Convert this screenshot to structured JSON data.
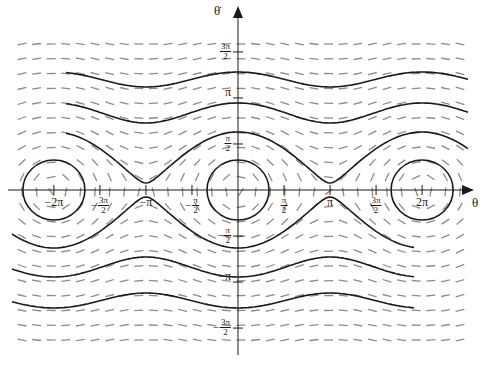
{
  "diagram": {
    "type": "phase-portrait",
    "title": "",
    "origin_px": [
      238,
      190
    ],
    "px_per_unit": 29.3,
    "colors": {
      "trajectory": "#1a1a1a",
      "slope_field": "#8c8c8c",
      "axis": "#1a1a1a"
    },
    "axes": {
      "x_label": "θ",
      "y_label": "θ̇",
      "x_ticks": [
        {
          "value": -6.2832,
          "label": "−2π",
          "type": "text"
        },
        {
          "value": -4.7124,
          "num": "3π",
          "den": "2",
          "sign": "−",
          "type": "frac"
        },
        {
          "value": -3.1416,
          "label": "−π",
          "type": "text"
        },
        {
          "value": -1.5708,
          "num": "π",
          "den": "2",
          "sign": "−",
          "type": "frac"
        },
        {
          "value": 1.5708,
          "num": "π",
          "den": "2",
          "sign": "",
          "type": "frac"
        },
        {
          "value": 3.1416,
          "label": "π",
          "type": "text"
        },
        {
          "value": 4.7124,
          "num": "3π",
          "den": "2",
          "sign": "",
          "type": "frac"
        },
        {
          "value": 6.2832,
          "label": "2π",
          "type": "text"
        }
      ],
      "y_ticks": [
        {
          "value": 4.7124,
          "num": "3π",
          "den": "2",
          "sign": "",
          "type": "frac"
        },
        {
          "value": 3.1416,
          "label": "π",
          "type": "text"
        },
        {
          "value": 1.5708,
          "num": "π",
          "den": "2",
          "sign": "",
          "type": "frac"
        },
        {
          "value": -1.5708,
          "num": "π",
          "den": "2",
          "sign": "−",
          "type": "frac"
        },
        {
          "value": -3.1416,
          "label": "−π",
          "type": "text"
        },
        {
          "value": -4.7124,
          "num": "3π",
          "den": "2",
          "sign": "−",
          "type": "frac"
        }
      ]
    },
    "slope_field": {
      "x_start_px": 22,
      "x_step_px": 14.6,
      "cols": 31,
      "y_start_px": 44,
      "y_step_px": 14.8,
      "rows": 21,
      "dash_len_px": 9
    },
    "trajectories": [
      {
        "kind": "rotation",
        "a": 12266,
        "b": 1657,
        "sign": 1,
        "x_range_px": [
          66,
          468
        ]
      },
      {
        "kind": "rotation",
        "a": 6029,
        "b": 1540,
        "sign": 1,
        "x_range_px": [
          66,
          468
        ]
      },
      {
        "kind": "rotation",
        "a": 1706,
        "b": 1657,
        "sign": 1,
        "x_range_px": [
          66,
          468
        ]
      },
      {
        "kind": "rotation",
        "a": 1706,
        "b": 1657,
        "sign": -1,
        "x_range_px": [
          12,
          414
        ]
      },
      {
        "kind": "rotation",
        "a": 6029,
        "b": 1540,
        "sign": -1,
        "x_range_px": [
          12,
          414
        ]
      },
      {
        "kind": "rotation",
        "a": 12266,
        "b": 1657,
        "sign": -1,
        "x_range_px": [
          12,
          414
        ]
      }
    ],
    "libration_orbits": [
      {
        "center_value": -6.2832,
        "rx_px": 31,
        "ry_px": 30
      },
      {
        "center_value": 0,
        "rx_px": 31,
        "ry_px": 30
      },
      {
        "center_value": 6.2832,
        "rx_px": 31,
        "ry_px": 30
      }
    ]
  }
}
